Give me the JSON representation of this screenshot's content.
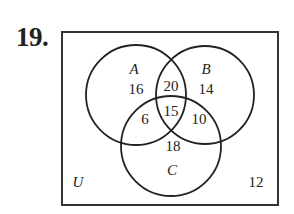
{
  "problem_number": "19.",
  "diagram": {
    "type": "venn-3-set",
    "universe_label": "U",
    "sets": [
      {
        "name": "A"
      },
      {
        "name": "B"
      },
      {
        "name": "C"
      }
    ],
    "regions": {
      "A_only": "16",
      "B_only": "14",
      "C_only": "18",
      "A_and_B_only": "20",
      "A_and_C_only": "6",
      "B_and_C_only": "10",
      "A_and_B_and_C": "15",
      "outside": "12"
    }
  }
}
